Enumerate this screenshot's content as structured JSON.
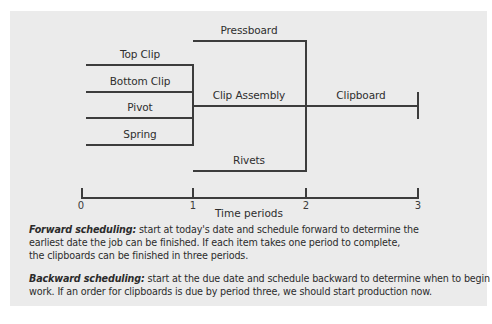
{
  "diagram": {
    "components": [
      {
        "label": "Top Clip"
      },
      {
        "label": "Bottom Clip"
      },
      {
        "label": "Pivot"
      },
      {
        "label": "Spring"
      }
    ],
    "subassembly": {
      "label": "Clip Assembly"
    },
    "parallel_parts": [
      {
        "label": "Pressboard"
      },
      {
        "label": "Rivets"
      }
    ],
    "final_product": {
      "label": "Clipboard"
    },
    "timeline": {
      "ticks": [
        "0",
        "1",
        "2",
        "3"
      ],
      "axis_label": "Time periods"
    },
    "colors": {
      "background": "#ebebeb",
      "lines": "#3c3c3c",
      "text": "#2b2b2b"
    }
  },
  "notes": {
    "forward": {
      "term": "Forward scheduling:",
      "lines": [
        " start at today's date and schedule forward to determine the",
        "earliest date the job can be finished. If each item takes one period to complete,",
        "the clipboards can be finished in three periods."
      ]
    },
    "backward": {
      "term": "Backward scheduling:",
      "lines": [
        " start at the due date and schedule backward to determine when to begin",
        "work. If an order for clipboards is due by period three, we should start production now."
      ]
    }
  }
}
